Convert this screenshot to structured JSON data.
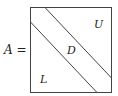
{
  "equation": {
    "lhs": "A",
    "operator": "="
  },
  "matrix": {
    "regions": [
      {
        "label": "U",
        "description": "upper triangular part"
      },
      {
        "label": "D",
        "description": "diagonal band"
      },
      {
        "label": "L",
        "description": "lower triangular part"
      }
    ]
  }
}
